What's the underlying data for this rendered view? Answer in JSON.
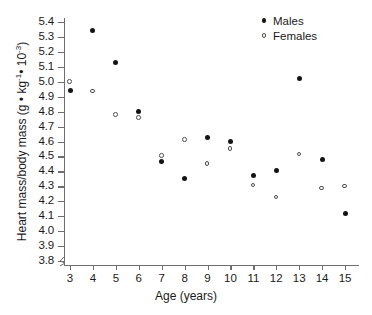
{
  "chart_data": {
    "type": "scatter",
    "title": "",
    "xlabel": "Age (years)",
    "ylabel": "Heart mass/body mass  (g • kg⁻¹• 10⁻³)",
    "ylabel_parts": {
      "main": "Heart mass/body mass  (g • kg",
      "sup1": "-1",
      "mid": "• 10",
      "sup2": "-3",
      "tail": ")"
    },
    "x": [
      3,
      4,
      5,
      6,
      7,
      8,
      9,
      10,
      11,
      12,
      13,
      14,
      15
    ],
    "xticks": [
      "3",
      "4",
      "5",
      "6",
      "7",
      "8",
      "9",
      "10",
      "11",
      "12",
      "13",
      "14",
      "15"
    ],
    "yticks": [
      "5.4",
      "5.3",
      "5.2",
      "5.1",
      "5.0",
      "4.9",
      "4.8",
      "4.7",
      "4.6",
      "4.5",
      "4.4",
      "4.3",
      "4.2",
      "4.1",
      "4.0",
      "3.9",
      "3.8"
    ],
    "ytick_values": [
      5.4,
      5.3,
      5.2,
      5.1,
      5.0,
      4.9,
      4.8,
      4.7,
      4.6,
      4.5,
      4.4,
      4.3,
      4.2,
      4.1,
      4.0,
      3.9,
      3.8
    ],
    "xlim": [
      2.4,
      15.6
    ],
    "ylim": [
      3.8,
      5.45
    ],
    "grid": false,
    "axis_break_y": true,
    "legend_position": "top-right",
    "series": [
      {
        "name": "Males",
        "marker": "filled-circle",
        "color": "#141414",
        "values": [
          4.94,
          5.345,
          5.13,
          4.8,
          4.465,
          4.35,
          4.63,
          4.6,
          4.375,
          4.405,
          5.02,
          4.48,
          4.12
        ]
      },
      {
        "name": "Females",
        "marker": "open-circle",
        "color": "#4d4d4d",
        "values": [
          5.0,
          4.935,
          4.78,
          4.76,
          4.505,
          4.61,
          4.45,
          4.55,
          4.305,
          4.225,
          4.515,
          4.285,
          4.3
        ]
      }
    ]
  },
  "legend": {
    "items": [
      {
        "label": "Males",
        "marker": "filled-circle"
      },
      {
        "label": "Females",
        "marker": "open-circle"
      }
    ]
  },
  "colors": {
    "axis": "#6e6e6e",
    "text": "#1a1a1a",
    "male": "#141414",
    "female": "#4d4d4d",
    "background": "#ffffff"
  }
}
